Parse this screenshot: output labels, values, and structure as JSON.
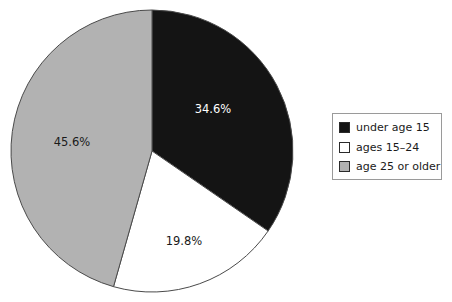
{
  "chart_data": {
    "type": "pie",
    "title": "",
    "categories": [
      "under age 15",
      "ages 15–24",
      "age 25 or older"
    ],
    "values": [
      34.6,
      19.8,
      45.6
    ],
    "value_labels": [
      "34.6%",
      "19.8%",
      "45.6%"
    ],
    "colors": [
      "#141414",
      "#ffffff",
      "#b2b2b2"
    ],
    "start_angle_deg": 0,
    "direction": "clockwise",
    "legend_position": "right",
    "legend_border": true,
    "grid": false,
    "xlabel": "",
    "ylabel": ""
  },
  "pie": {
    "center_x": 152,
    "center_y": 151,
    "radius": 141,
    "stroke": "#4a4a4a",
    "slices": [
      {
        "name": "under age 15",
        "percent_label": "34.6%",
        "value": 34.6,
        "fill": "#141414",
        "label_color": "#ffffff",
        "label_x": 213,
        "label_y": 113
      },
      {
        "name": "ages 15–24",
        "percent_label": "19.8%",
        "value": 19.8,
        "fill": "#ffffff",
        "label_color": "#1a1a1a",
        "label_x": 184,
        "label_y": 245
      },
      {
        "name": "age 25 or older",
        "percent_label": "45.6%",
        "value": 45.6,
        "fill": "#b2b2b2",
        "label_color": "#1a1a1a",
        "label_x": 72,
        "label_y": 146
      }
    ]
  },
  "legend": {
    "items": [
      {
        "label": "under age 15",
        "swatch_color": "#141414"
      },
      {
        "label": "ages 15–24",
        "swatch_color": "#ffffff"
      },
      {
        "label": "age 25 or older",
        "swatch_color": "#b2b2b2"
      }
    ]
  }
}
